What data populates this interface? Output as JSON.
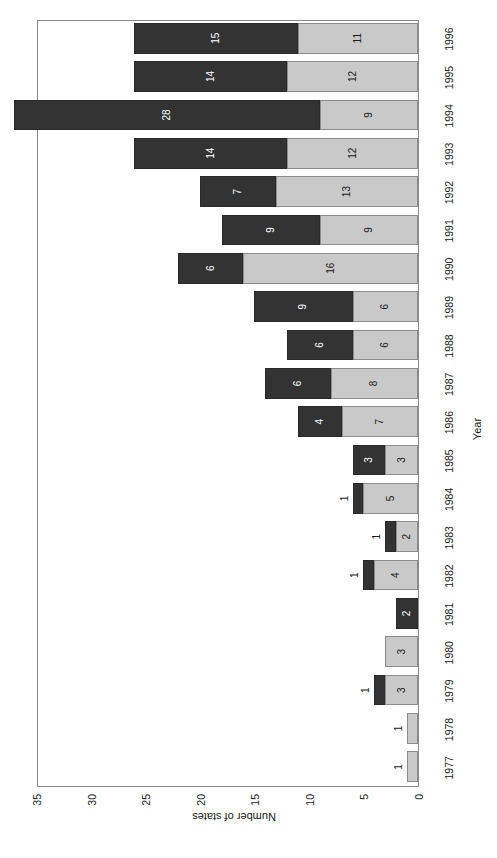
{
  "chart_data": {
    "type": "bar",
    "subtype": "stacked-bar",
    "title": "",
    "xlabel": "Year",
    "ylabel": "Number of states",
    "ylim": [
      0,
      35
    ],
    "yticks": [
      0,
      5,
      10,
      15,
      20,
      25,
      30,
      35
    ],
    "grid": false,
    "legend_position": "bottom-right",
    "orientation": "rotated-90-ccw",
    "categories": [
      "1977",
      "1978",
      "1979",
      "1980",
      "1981",
      "1982",
      "1983",
      "1984",
      "1985",
      "1986",
      "1987",
      "1988",
      "1989",
      "1990",
      "1991",
      "1992",
      "1993",
      "1994",
      "1995",
      "1996"
    ],
    "series": [
      {
        "name": "15% to 25%",
        "color": "#c9c9c9",
        "values": [
          1,
          1,
          3,
          3,
          0,
          4,
          2,
          5,
          3,
          7,
          8,
          6,
          6,
          16,
          9,
          13,
          12,
          9,
          12,
          11
        ]
      },
      {
        "name": "Over 25%",
        "color": "#333333",
        "values": [
          0,
          0,
          1,
          0,
          2,
          1,
          1,
          1,
          3,
          4,
          6,
          6,
          9,
          6,
          9,
          7,
          14,
          28,
          14,
          15
        ]
      }
    ]
  },
  "legend": {
    "items": [
      {
        "label": "15% to 25%",
        "swatch": "light"
      },
      {
        "label": "Over 25%",
        "swatch": "dark"
      }
    ]
  },
  "axes": {
    "y_title": "Number of states",
    "x_title": "Year",
    "y_tick_labels": [
      "0",
      "5",
      "10",
      "15",
      "20",
      "25",
      "30",
      "35"
    ],
    "x_tick_labels": [
      "1977",
      "1978",
      "1979",
      "1980",
      "1981",
      "1982",
      "1983",
      "1984",
      "1985",
      "1986",
      "1987",
      "1988",
      "1989",
      "1990",
      "1991",
      "1992",
      "1993",
      "1994",
      "1995",
      "1996"
    ]
  },
  "colors": {
    "light_segment": "#c9c9c9",
    "dark_segment": "#333333",
    "frame": "#8a8a8a",
    "text": "#1a1a1a",
    "background": "#ffffff"
  }
}
